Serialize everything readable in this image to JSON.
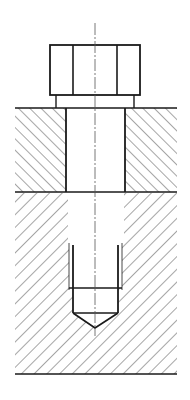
{
  "drawing": {
    "title": "Bolted joint section view with blind tapped hole",
    "colors": {
      "background": "#ffffff",
      "outline": "#1a1a1a",
      "hatch": "#3a3a3a",
      "centerline": "#555555"
    },
    "parts": [
      {
        "id": "bolt-head",
        "label": "Hex bolt head"
      },
      {
        "id": "washer-face",
        "label": "Bolt shoulder / washer face"
      },
      {
        "id": "upper-plate",
        "label": "Upper plate (clearance hole)"
      },
      {
        "id": "lower-plate",
        "label": "Lower plate (blind tapped hole)"
      },
      {
        "id": "tapped-hole",
        "label": "Threaded hole with drill point"
      },
      {
        "id": "centerline",
        "label": "Axis centerline"
      }
    ],
    "geometry": {
      "centerline_x": 95,
      "centerline_y": [
        23,
        336
      ],
      "bolt_head": {
        "x": 50,
        "y": 45,
        "w": 90,
        "h": 50,
        "flat_lines_x": [
          73,
          117
        ]
      },
      "washer_face": {
        "x": 56,
        "y": 95,
        "w": 78,
        "h": 13
      },
      "upper_plate": {
        "x": 15,
        "y": 108,
        "w": 162,
        "h": 84,
        "hole_x": [
          66,
          125
        ]
      },
      "lower_plate": {
        "x": 15,
        "y": 192,
        "w": 162,
        "h": 182,
        "hole_x": [
          68,
          124
        ]
      },
      "tapped_hole": {
        "minor_x": [
          73,
          118
        ],
        "major_x": [
          69,
          122
        ],
        "top_y": 244,
        "thread_end_y": 288,
        "drill_end_y": 313,
        "tip": [
          95,
          328
        ]
      }
    }
  }
}
